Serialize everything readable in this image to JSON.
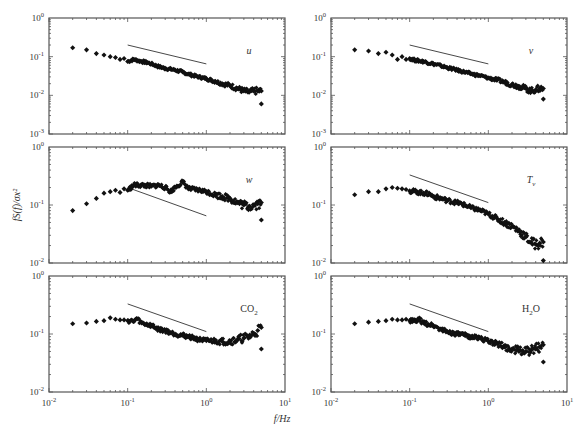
{
  "figure": {
    "xlabel": "f/Hz",
    "ylabel": "fS(f)/σx²",
    "x_tick_labels": [
      "10",
      "10",
      "10",
      "10"
    ],
    "x_tick_exponents": [
      "-2",
      "-1",
      "0",
      "1"
    ],
    "colors": {
      "axis": "#555555",
      "marker": "#111111",
      "slope_line": "#333333"
    }
  },
  "chart_data": [
    {
      "type": "scatter",
      "panel": "u",
      "label": "u",
      "xscale": "log",
      "yscale": "log",
      "xlim": [
        0.01,
        10
      ],
      "ylim": [
        0.001,
        1
      ],
      "y_tick_labels": [
        "10^0",
        "10^-1",
        "10^-2",
        "10^-3"
      ],
      "points": [
        [
          0.02,
          0.17
        ],
        [
          0.03,
          0.15
        ],
        [
          0.04,
          0.12
        ],
        [
          0.05,
          0.11
        ],
        [
          0.06,
          0.1
        ],
        [
          0.07,
          0.095
        ],
        [
          0.08,
          0.085
        ],
        [
          0.09,
          0.09
        ],
        [
          0.1,
          0.075
        ],
        [
          0.12,
          0.085
        ],
        [
          0.15,
          0.075
        ],
        [
          0.18,
          0.07
        ],
        [
          0.2,
          0.065
        ],
        [
          0.25,
          0.055
        ],
        [
          0.3,
          0.05
        ],
        [
          0.4,
          0.045
        ],
        [
          0.5,
          0.04
        ],
        [
          0.6,
          0.035
        ],
        [
          0.8,
          0.03
        ],
        [
          1.0,
          0.027
        ],
        [
          1.3,
          0.023
        ],
        [
          1.6,
          0.02
        ],
        [
          2.0,
          0.018
        ],
        [
          2.5,
          0.015
        ],
        [
          3.0,
          0.013
        ],
        [
          3.5,
          0.012
        ],
        [
          4.0,
          0.013
        ],
        [
          4.5,
          0.013
        ],
        [
          5.0,
          0.013
        ],
        [
          5.0,
          0.006
        ]
      ],
      "slope_line": [
        [
          0.1,
          0.2
        ],
        [
          1.0,
          0.065
        ]
      ]
    },
    {
      "type": "scatter",
      "panel": "v",
      "label": "v",
      "xscale": "log",
      "yscale": "log",
      "xlim": [
        0.01,
        10
      ],
      "ylim": [
        0.001,
        1
      ],
      "y_tick_labels": [
        "10^0",
        "10^-1",
        "10^-2",
        "10^-3"
      ],
      "points": [
        [
          0.02,
          0.15
        ],
        [
          0.03,
          0.14
        ],
        [
          0.04,
          0.12
        ],
        [
          0.05,
          0.13
        ],
        [
          0.06,
          0.11
        ],
        [
          0.07,
          0.085
        ],
        [
          0.08,
          0.1
        ],
        [
          0.09,
          0.085
        ],
        [
          0.1,
          0.09
        ],
        [
          0.12,
          0.08
        ],
        [
          0.15,
          0.075
        ],
        [
          0.2,
          0.065
        ],
        [
          0.25,
          0.058
        ],
        [
          0.3,
          0.052
        ],
        [
          0.4,
          0.045
        ],
        [
          0.5,
          0.04
        ],
        [
          0.6,
          0.036
        ],
        [
          0.8,
          0.032
        ],
        [
          1.0,
          0.028
        ],
        [
          1.3,
          0.025
        ],
        [
          1.6,
          0.022
        ],
        [
          2.0,
          0.019
        ],
        [
          2.5,
          0.017
        ],
        [
          3.0,
          0.015
        ],
        [
          3.5,
          0.013
        ],
        [
          4.0,
          0.014
        ],
        [
          4.5,
          0.015
        ],
        [
          5.0,
          0.015
        ],
        [
          5.0,
          0.008
        ]
      ],
      "slope_line": [
        [
          0.1,
          0.2
        ],
        [
          1.0,
          0.065
        ]
      ]
    },
    {
      "type": "scatter",
      "panel": "w",
      "label": "w",
      "xscale": "log",
      "yscale": "log",
      "xlim": [
        0.01,
        10
      ],
      "ylim": [
        0.01,
        1
      ],
      "y_tick_labels": [
        "10^0",
        "10^-1",
        "10^-2"
      ],
      "points": [
        [
          0.02,
          0.08
        ],
        [
          0.03,
          0.105
        ],
        [
          0.04,
          0.13
        ],
        [
          0.05,
          0.16
        ],
        [
          0.06,
          0.17
        ],
        [
          0.07,
          0.18
        ],
        [
          0.08,
          0.165
        ],
        [
          0.09,
          0.19
        ],
        [
          0.1,
          0.18
        ],
        [
          0.12,
          0.22
        ],
        [
          0.15,
          0.22
        ],
        [
          0.2,
          0.21
        ],
        [
          0.25,
          0.22
        ],
        [
          0.3,
          0.2
        ],
        [
          0.35,
          0.17
        ],
        [
          0.4,
          0.2
        ],
        [
          0.5,
          0.25
        ],
        [
          0.6,
          0.19
        ],
        [
          0.8,
          0.18
        ],
        [
          1.0,
          0.17
        ],
        [
          1.3,
          0.15
        ],
        [
          1.6,
          0.14
        ],
        [
          2.0,
          0.13
        ],
        [
          2.5,
          0.11
        ],
        [
          3.0,
          0.1
        ],
        [
          3.5,
          0.095
        ],
        [
          4.0,
          0.1
        ],
        [
          4.5,
          0.105
        ],
        [
          5.0,
          0.11
        ],
        [
          5.0,
          0.055
        ]
      ],
      "slope_line": [
        [
          0.1,
          0.2
        ],
        [
          1.0,
          0.065
        ]
      ]
    },
    {
      "type": "scatter",
      "panel": "Tv",
      "label": "T",
      "label_sub": "v",
      "xscale": "log",
      "yscale": "log",
      "xlim": [
        0.01,
        10
      ],
      "ylim": [
        0.01,
        1
      ],
      "y_tick_labels": [
        "10^0",
        "10^-1",
        "10^-2"
      ],
      "points": [
        [
          0.02,
          0.15
        ],
        [
          0.03,
          0.17
        ],
        [
          0.04,
          0.17
        ],
        [
          0.05,
          0.19
        ],
        [
          0.06,
          0.2
        ],
        [
          0.07,
          0.195
        ],
        [
          0.08,
          0.19
        ],
        [
          0.09,
          0.185
        ],
        [
          0.1,
          0.175
        ],
        [
          0.12,
          0.17
        ],
        [
          0.15,
          0.16
        ],
        [
          0.18,
          0.155
        ],
        [
          0.2,
          0.14
        ],
        [
          0.25,
          0.13
        ],
        [
          0.3,
          0.12
        ],
        [
          0.4,
          0.11
        ],
        [
          0.5,
          0.1
        ],
        [
          0.6,
          0.09
        ],
        [
          0.8,
          0.08
        ],
        [
          1.0,
          0.07
        ],
        [
          1.3,
          0.058
        ],
        [
          1.6,
          0.05
        ],
        [
          2.0,
          0.043
        ],
        [
          2.5,
          0.035
        ],
        [
          3.0,
          0.028
        ],
        [
          3.5,
          0.023
        ],
        [
          4.0,
          0.021
        ],
        [
          4.5,
          0.022
        ],
        [
          5.0,
          0.023
        ],
        [
          5.0,
          0.011
        ]
      ],
      "slope_line": [
        [
          0.1,
          0.33
        ],
        [
          1.0,
          0.11
        ]
      ]
    },
    {
      "type": "scatter",
      "panel": "CO2",
      "label": "CO",
      "label_sub": "2",
      "xscale": "log",
      "yscale": "log",
      "xlim": [
        0.01,
        10
      ],
      "ylim": [
        0.01,
        1
      ],
      "y_tick_labels": [
        "10^0",
        "10^-1",
        "10^-2"
      ],
      "points": [
        [
          0.02,
          0.15
        ],
        [
          0.03,
          0.155
        ],
        [
          0.04,
          0.165
        ],
        [
          0.05,
          0.17
        ],
        [
          0.06,
          0.19
        ],
        [
          0.07,
          0.18
        ],
        [
          0.08,
          0.175
        ],
        [
          0.09,
          0.175
        ],
        [
          0.1,
          0.17
        ],
        [
          0.12,
          0.165
        ],
        [
          0.13,
          0.185
        ],
        [
          0.15,
          0.155
        ],
        [
          0.2,
          0.14
        ],
        [
          0.25,
          0.12
        ],
        [
          0.3,
          0.115
        ],
        [
          0.4,
          0.1
        ],
        [
          0.5,
          0.095
        ],
        [
          0.6,
          0.09
        ],
        [
          0.8,
          0.08
        ],
        [
          1.0,
          0.077
        ],
        [
          1.3,
          0.076
        ],
        [
          1.6,
          0.074
        ],
        [
          2.0,
          0.075
        ],
        [
          2.5,
          0.08
        ],
        [
          3.0,
          0.085
        ],
        [
          3.5,
          0.09
        ],
        [
          4.0,
          0.1
        ],
        [
          4.5,
          0.115
        ],
        [
          5.0,
          0.13
        ],
        [
          5.0,
          0.055
        ]
      ],
      "slope_line": [
        [
          0.1,
          0.33
        ],
        [
          1.0,
          0.11
        ]
      ]
    },
    {
      "type": "scatter",
      "panel": "H2O",
      "label": "H",
      "label_sub": "2",
      "label_tail": "O",
      "xscale": "log",
      "yscale": "log",
      "xlim": [
        0.01,
        10
      ],
      "ylim": [
        0.01,
        1
      ],
      "y_tick_labels": [
        "10^0",
        "10^-1",
        "10^-2"
      ],
      "points": [
        [
          0.02,
          0.15
        ],
        [
          0.03,
          0.16
        ],
        [
          0.04,
          0.165
        ],
        [
          0.05,
          0.17
        ],
        [
          0.06,
          0.18
        ],
        [
          0.07,
          0.175
        ],
        [
          0.08,
          0.175
        ],
        [
          0.09,
          0.18
        ],
        [
          0.1,
          0.17
        ],
        [
          0.12,
          0.165
        ],
        [
          0.13,
          0.18
        ],
        [
          0.15,
          0.155
        ],
        [
          0.2,
          0.14
        ],
        [
          0.25,
          0.12
        ],
        [
          0.3,
          0.11
        ],
        [
          0.4,
          0.1
        ],
        [
          0.5,
          0.095
        ],
        [
          0.6,
          0.09
        ],
        [
          0.8,
          0.085
        ],
        [
          1.0,
          0.075
        ],
        [
          1.3,
          0.068
        ],
        [
          1.6,
          0.06
        ],
        [
          2.0,
          0.055
        ],
        [
          2.5,
          0.052
        ],
        [
          3.0,
          0.05
        ],
        [
          3.5,
          0.052
        ],
        [
          4.0,
          0.055
        ],
        [
          4.5,
          0.06
        ],
        [
          5.0,
          0.065
        ],
        [
          5.0,
          0.033
        ]
      ],
      "slope_line": [
        [
          0.1,
          0.33
        ],
        [
          1.0,
          0.11
        ]
      ]
    }
  ]
}
